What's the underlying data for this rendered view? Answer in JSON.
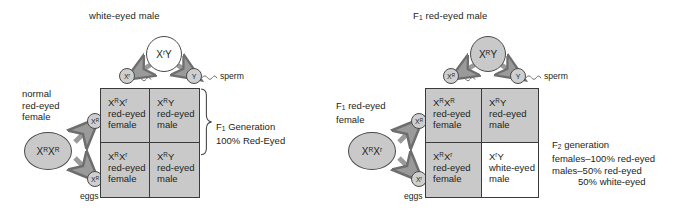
{
  "figure": {
    "type": "punnett-square-diagram",
    "topic": "X-linked inheritance of eye color in Drosophila",
    "colors": {
      "cell_shaded": "#c9c9c9",
      "cell_unshaded": "#ffffff",
      "stroke": "#3b3b3b",
      "text": "#231f20",
      "arrow": "#8a8a8a"
    }
  },
  "cross_one": {
    "male_header": "white-eyed male",
    "male_parent": {
      "genotype_x": "X",
      "genotype_sup": "r",
      "genotype_tail": "Y",
      "shaded": false
    },
    "female_label_lines": [
      "normal",
      "red-eyed",
      "female"
    ],
    "female_parent": {
      "allele1_x": "X",
      "allele1_sup": "R",
      "allele2_x": "X",
      "allele2_sup": "R",
      "shaded": true
    },
    "sperm_label": "sperm",
    "eggs_label": "eggs",
    "sperm_gametes": [
      {
        "base": "X",
        "sup": "r",
        "shaded": true
      },
      {
        "base": "Y",
        "sup": "",
        "shaded": true
      }
    ],
    "egg_gametes": [
      {
        "base": "X",
        "sup": "R",
        "shaded": true
      },
      {
        "base": "X",
        "sup": "R",
        "shaded": true
      }
    ],
    "cells": [
      {
        "g1_x": "X",
        "g1_sup": "R",
        "g2_x": "X",
        "g2_sup": "r",
        "pheno_line1": "red-eyed",
        "pheno_line2": "female",
        "shaded": true
      },
      {
        "g1_x": "X",
        "g1_sup": "R",
        "g2_x": "Y",
        "g2_sup": "",
        "pheno_line1": "red-eyed",
        "pheno_line2": "male",
        "shaded": true
      },
      {
        "g1_x": "X",
        "g1_sup": "R",
        "g2_x": "X",
        "g2_sup": "r",
        "pheno_line1": "red-eyed",
        "pheno_line2": "female",
        "shaded": true
      },
      {
        "g1_x": "X",
        "g1_sup": "R",
        "g2_x": "Y",
        "g2_sup": "",
        "pheno_line1": "red-eyed",
        "pheno_line2": "male",
        "shaded": true
      }
    ],
    "result": {
      "line1_pre": "F",
      "line1_sub": "1",
      "line1_post": " Generation",
      "line2": "100% Red-Eyed",
      "has_brace": true
    }
  },
  "cross_two": {
    "male_header_pre": "F",
    "male_header_sub": "1",
    "male_header_post": " red-eyed male",
    "male_parent": {
      "genotype_x": "X",
      "genotype_sup": "R",
      "genotype_tail": "Y",
      "shaded": true
    },
    "female_label_pre": "F",
    "female_label_sub": "1",
    "female_label_post": " red-eyed",
    "female_label_line2": "female",
    "female_parent": {
      "allele1_x": "X",
      "allele1_sup": "R",
      "allele2_x": "X",
      "allele2_sup": "r",
      "shaded": true
    },
    "sperm_label": "sperm",
    "eggs_label": "eggs",
    "sperm_gametes": [
      {
        "base": "X",
        "sup": "R",
        "shaded": true
      },
      {
        "base": "Y",
        "sup": "",
        "shaded": true
      }
    ],
    "egg_gametes": [
      {
        "base": "X",
        "sup": "R",
        "shaded": true
      },
      {
        "base": "X",
        "sup": "r",
        "shaded": true
      }
    ],
    "cells": [
      {
        "g1_x": "X",
        "g1_sup": "R",
        "g2_x": "X",
        "g2_sup": "R",
        "pheno_line1": "red-eyed",
        "pheno_line2": "female",
        "shaded": true
      },
      {
        "g1_x": "X",
        "g1_sup": "R",
        "g2_x": "Y",
        "g2_sup": "",
        "pheno_line1": "red-eyed",
        "pheno_line2": "male",
        "shaded": true
      },
      {
        "g1_x": "X",
        "g1_sup": "R",
        "g2_x": "X",
        "g2_sup": "r",
        "pheno_line1": "red-eyed",
        "pheno_line2": "female",
        "shaded": true
      },
      {
        "g1_x": "X",
        "g1_sup": "r",
        "g2_x": "Y",
        "g2_sup": "",
        "pheno_line1": "white-eyed",
        "pheno_line2": "male",
        "shaded": false
      }
    ],
    "result": {
      "line1_pre": "F",
      "line1_sub": "2",
      "line1_post": " generation",
      "line2": "females–100% red-eyed",
      "line3": "males–50% red-eyed",
      "line4": "50% white-eyed",
      "has_brace": false
    }
  }
}
